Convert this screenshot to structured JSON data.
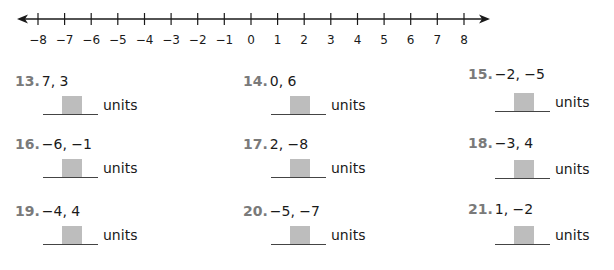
{
  "number_line": {
    "min": -8,
    "max": 8,
    "ticks": [
      "−8",
      "−7",
      "−6",
      "−5",
      "−4",
      "−3",
      "−2",
      "−1",
      "0",
      "1",
      "2",
      "3",
      "4",
      "5",
      "6",
      "7",
      "8"
    ],
    "arrows": "both"
  },
  "units_label": "units",
  "problems": [
    {
      "number": "13.",
      "values": "7, 3"
    },
    {
      "number": "14.",
      "values": "0, 6"
    },
    {
      "number": "15.",
      "values": "−2, −5"
    },
    {
      "number": "16.",
      "values": "−6, −1"
    },
    {
      "number": "17.",
      "values": "2, −8"
    },
    {
      "number": "18.",
      "values": "−3, 4"
    },
    {
      "number": "19.",
      "values": "−4, 4"
    },
    {
      "number": "20.",
      "values": "−5, −7"
    },
    {
      "number": "21.",
      "values": "1, −2"
    }
  ],
  "colors": {
    "problem_number": "#7a7a7a",
    "answer_box": "#bdbdbd",
    "text": "#1a1a1a"
  }
}
